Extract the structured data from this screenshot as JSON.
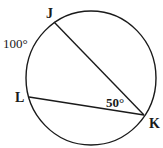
{
  "diagram": {
    "type": "circle-inscribed-angle",
    "circle": {
      "cx": 91,
      "cy": 78,
      "rx": 65,
      "ry": 67,
      "stroke": "#1a1a1a"
    },
    "points": {
      "J": {
        "label": "J",
        "x": 54,
        "y": 22
      },
      "L": {
        "label": "L",
        "x": 29,
        "y": 97
      },
      "K": {
        "label": "K",
        "x": 144,
        "y": 115
      }
    },
    "chords": [
      {
        "from": "J",
        "to": "K"
      },
      {
        "from": "L",
        "to": "K"
      }
    ],
    "annotations": {
      "arc_JL": "100°",
      "angle_K": "50°"
    }
  }
}
